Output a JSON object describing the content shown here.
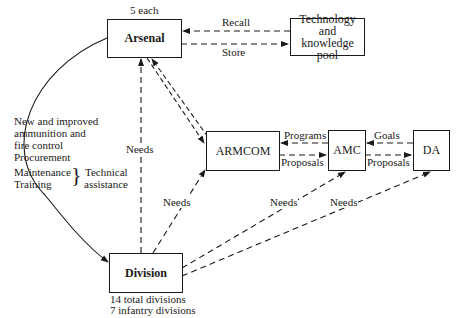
{
  "nodes": {
    "arsenal": {
      "label": "Arsenal",
      "note": "5 each"
    },
    "tech_pool": {
      "line1": "Technology",
      "line2": "and",
      "line3": "knowledge pool"
    },
    "armcom": {
      "label": "ARMCOM"
    },
    "amc": {
      "label": "AMC"
    },
    "da": {
      "label": "DA"
    },
    "division": {
      "label": "Division",
      "note1": "14 total divisions",
      "note2": "7 infantry divisions"
    }
  },
  "edges": {
    "recall": "Recall",
    "store": "Store",
    "programs": "Programs",
    "goals": "Goals",
    "proposals_armcom_amc": "Proposals",
    "proposals_amc_da": "Proposals",
    "needs_division_arsenal": "Needs",
    "needs_division_armcom": "Needs",
    "needs_division_amc": "Needs",
    "needs_division_da": "Needs"
  },
  "arsenal_to_division": {
    "line1": "New and improved",
    "line2": "ammunition and",
    "line3": "fire control",
    "line4": "Procurement",
    "line5": "Maintenance",
    "line6": "Training",
    "brace_label1": "Technical",
    "brace_label2": "assistance"
  }
}
